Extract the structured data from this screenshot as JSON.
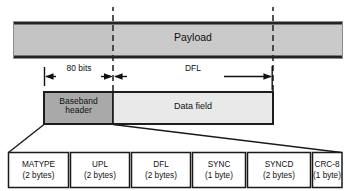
{
  "diagram": {
    "payload": {
      "label": "Payload"
    },
    "dimensions": [
      {
        "label": "80 bits",
        "name": "header-length"
      },
      {
        "label": "DFL",
        "name": "data-field-length"
      }
    ],
    "frame": {
      "baseband_header": "Baseband\nheader",
      "baseband_header_line1": "Baseband",
      "baseband_header_line2": "header",
      "data_field": "Data field"
    },
    "header_fields": [
      {
        "name": "MATYPE",
        "size": "(2 bytes)"
      },
      {
        "name": "UPL",
        "size": "(2 bytes)"
      },
      {
        "name": "DFL",
        "size": "(2 bytes)"
      },
      {
        "name": "SYNC",
        "size": "(1 byte)"
      },
      {
        "name": "SYNCD",
        "size": "(2 bytes)"
      },
      {
        "name": "CRC-8",
        "size": "(1 byte)"
      }
    ],
    "colors": {
      "payload_left_fill": "#c4c4c4",
      "payload_right_fill": "#c9c9c9",
      "baseband_header_fill": "#a9a9a9",
      "data_field_fill": "#e9e9e9",
      "cell_fill": "#ffffff",
      "stroke": "#1a1a1a",
      "text": "#111111"
    }
  }
}
